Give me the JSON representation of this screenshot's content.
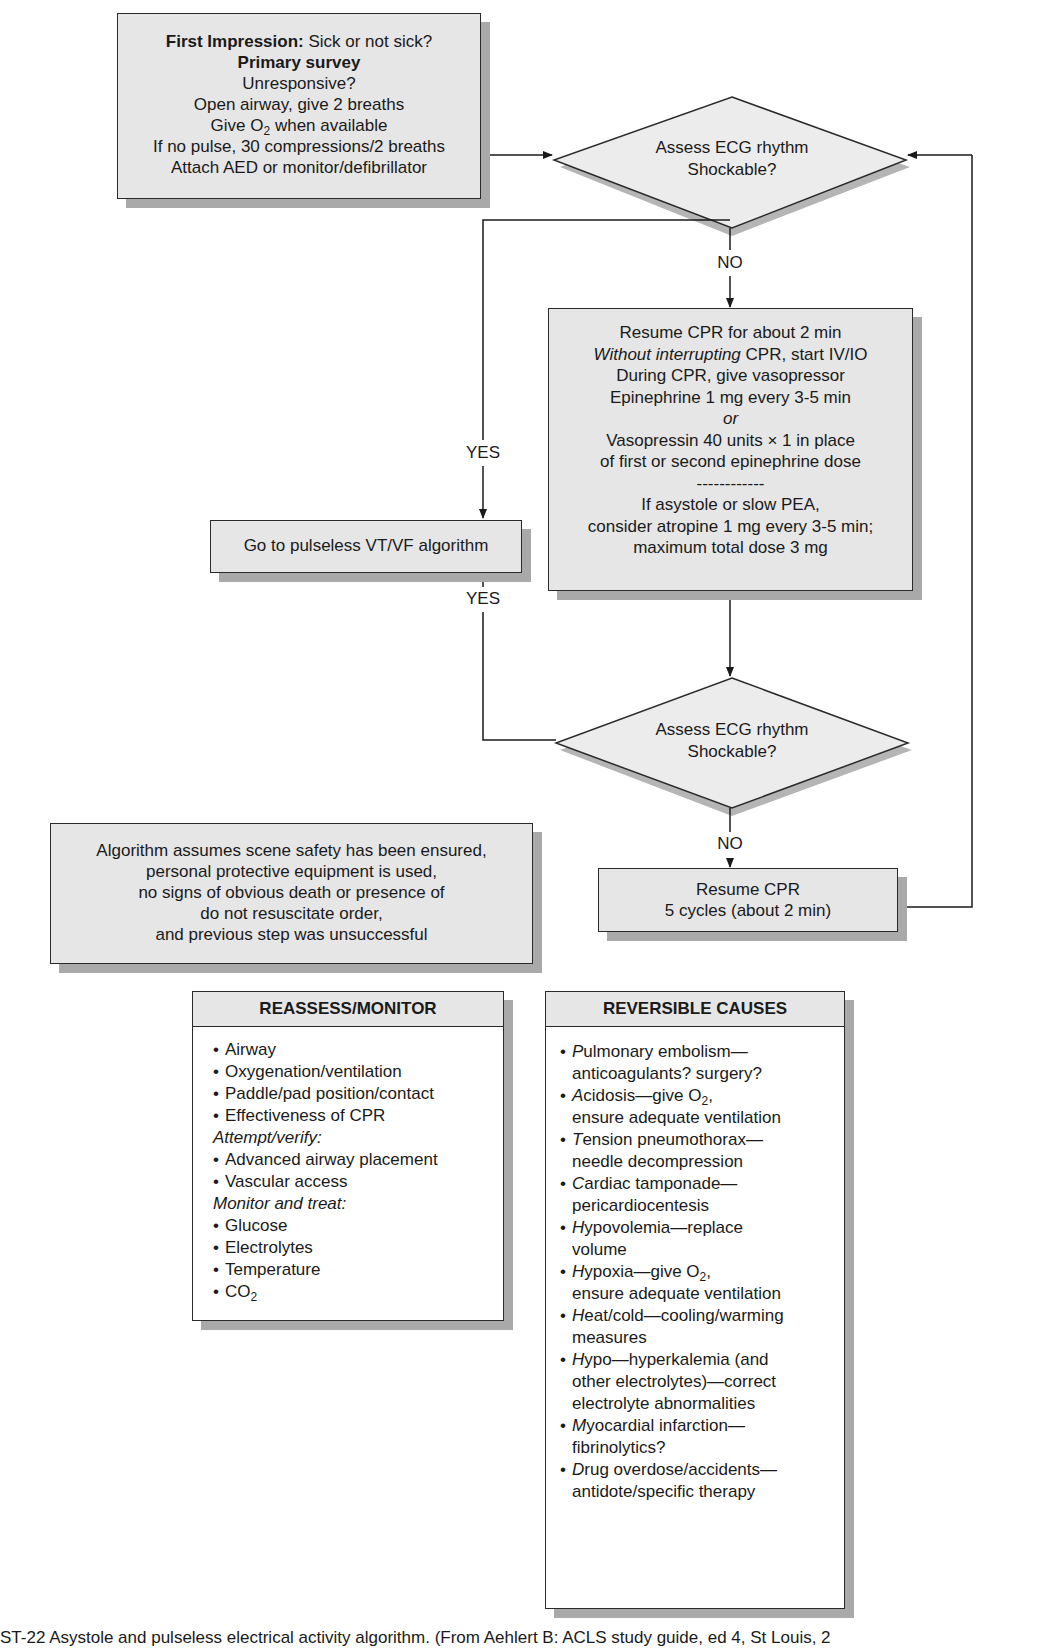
{
  "flowchart": {
    "start_box": {
      "first_impression_label": "First Impression:",
      "first_impression_text": " Sick or not sick?",
      "primary_survey": "Primary survey",
      "lines": [
        "Unresponsive?",
        "Open airway, give 2 breaths"
      ],
      "give_o2_prefix": "Give O",
      "give_o2_sub": "2",
      "give_o2_suffix": " when available",
      "lines_after": [
        "If no pulse, 30 compressions/2 breaths",
        "Attach AED or monitor/defibrillator"
      ]
    },
    "decision_1": {
      "line1": "Assess ECG rhythm",
      "line2": "Shockable?"
    },
    "decision_2": {
      "line1": "Assess ECG rhythm",
      "line2": "Shockable?"
    },
    "labels": {
      "no_1": "NO",
      "no_2": "NO",
      "yes_1": "YES",
      "yes_2": "YES"
    },
    "go_to_box": {
      "text": "Go to pulseless VT/VF algorithm"
    },
    "cpr_box": {
      "line1": "Resume CPR for about 2 min",
      "line2_italic": "Without interrupting",
      "line2_rest": " CPR, start IV/IO",
      "line3": "During CPR, give vasopressor",
      "line4": "Epinephrine 1 mg every 3-5 min",
      "line5_italic": "or",
      "line6": "Vasopressin 40 units × 1 in place",
      "line7": "of first or second epinephrine dose",
      "divider": "------------",
      "line8": "If asystole or slow PEA,",
      "line9": "consider atropine 1 mg every 3-5 min;",
      "line10": "maximum total dose 3 mg"
    },
    "resume_box": {
      "line1": "Resume CPR",
      "line2": "5 cycles (about 2 min)"
    },
    "assumption_box": {
      "lines": [
        "Algorithm assumes scene safety has been ensured,",
        "personal protective equipment is used,",
        "no signs of obvious death or presence of",
        "do not resuscitate order,",
        "and previous step was unsuccessful"
      ]
    }
  },
  "reassess_panel": {
    "title": "REASSESS/MONITOR",
    "items_1": [
      "Airway",
      "Oxygenation/ventilation",
      "Paddle/pad position/contact",
      "Effectiveness of CPR"
    ],
    "subhead_1": "Attempt/verify:",
    "items_2": [
      "Advanced airway placement",
      "Vascular access"
    ],
    "subhead_2": "Monitor and treat:",
    "items_3": [
      "Glucose",
      "Electrolytes",
      "Temperature"
    ],
    "co2_prefix": "CO",
    "co2_sub": "2",
    "bullet": "•"
  },
  "reversible_panel": {
    "title": "REVERSIBLE CAUSES",
    "bullet": "•",
    "items": [
      {
        "initial": "P",
        "rest": "ulmonary embolism—",
        "cont": "anticoagulants? surgery?"
      },
      {
        "initial": "A",
        "rest": "cidosis—give O",
        "sub": "2",
        "after": ",",
        "cont": "ensure adequate ventilation"
      },
      {
        "initial": "T",
        "rest": "ension pneumothorax—",
        "cont": "needle decompression"
      },
      {
        "initial": "C",
        "rest": "ardiac tamponade—",
        "cont": "pericardiocentesis"
      },
      {
        "initial": "H",
        "rest": "ypovolemia—replace",
        "cont": "volume"
      },
      {
        "initial": "H",
        "rest": "ypoxia—give O",
        "sub": "2",
        "after": ",",
        "cont": "ensure adequate ventilation"
      },
      {
        "initial": "H",
        "rest": "eat/cold—cooling/warming",
        "cont": "measures"
      },
      {
        "initial": "H",
        "rest": "ypo—hyperkalemia (and",
        "cont": "other electrolytes)—correct",
        "cont2": "electrolyte abnormalities"
      },
      {
        "initial": "M",
        "rest": "yocardial infarction—",
        "cont": "fibrinolytics?"
      },
      {
        "initial": "D",
        "rest": "rug overdose/accidents—",
        "cont": "antidote/specific therapy"
      }
    ]
  },
  "caption": {
    "text": "ST-22  Asystole and pulseless electrical activity algorithm. (From Aehlert B: ACLS study guide, ed 4, St Louis, 2"
  },
  "colors": {
    "box_fill": "#e6e6e6",
    "shadow": "#a9a9a9",
    "stroke": "#2a2a2a",
    "diamond_fill": "#ececec"
  }
}
